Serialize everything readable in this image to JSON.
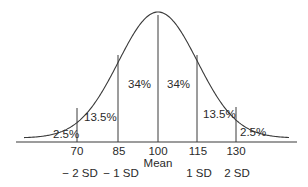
{
  "chart_data": {
    "type": "area",
    "title": "",
    "xlabel": "",
    "ylabel": "",
    "mean": 100,
    "sd": 15,
    "grid": false,
    "legend": null,
    "x_ticks": [
      70,
      85,
      100,
      115,
      130
    ],
    "x_tick_labels": [
      "70",
      "85",
      "100",
      "115",
      "130"
    ],
    "x_sub_labels": [
      "− 2 SD",
      "− 1 SD",
      "Mean",
      "1 SD",
      "2 SD"
    ],
    "regions": [
      {
        "from": null,
        "to": 70,
        "label": "2.5%",
        "value": 2.5
      },
      {
        "from": 70,
        "to": 85,
        "label": "13.5%",
        "value": 13.5
      },
      {
        "from": 85,
        "to": 100,
        "label": "34%",
        "value": 34
      },
      {
        "from": 100,
        "to": 115,
        "label": "34%",
        "value": 34
      },
      {
        "from": 115,
        "to": 130,
        "label": "13.5%",
        "value": 13.5
      },
      {
        "from": 130,
        "to": null,
        "label": "2.5%",
        "value": 2.5
      }
    ],
    "colors": {
      "line": "#3a3a3a",
      "text": "#2a2a2a",
      "background": "#ffffff"
    }
  },
  "labels": {
    "regions": [
      "2.5%",
      "13.5%",
      "34%",
      "34%",
      "13.5%",
      "2.5%"
    ],
    "ticks": [
      "70",
      "85",
      "100",
      "115",
      "130"
    ],
    "mean": "Mean",
    "sd": [
      "− 2 SD",
      "− 1 SD",
      "1 SD",
      "2 SD"
    ]
  }
}
